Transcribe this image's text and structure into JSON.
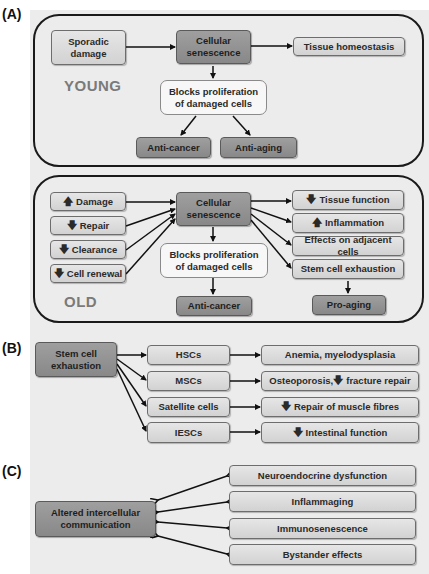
{
  "panel_a": {
    "label": "(A)",
    "young": {
      "stage_label": "YOUNG",
      "sporadic_damage": "Sporadic damage",
      "cellular_senescence": "Cellular senescence",
      "tissue_homeostasis": "Tissue homeostasis",
      "blocks_proliferation": "Blocks proliferation of damaged cells",
      "anti_cancer": "Anti-cancer",
      "anti_aging": "Anti-aging"
    },
    "old": {
      "stage_label": "OLD",
      "inputs": [
        {
          "arrow": "up",
          "glyph": "🡅",
          "label": "Damage"
        },
        {
          "arrow": "down",
          "glyph": "🡇",
          "label": "Repair"
        },
        {
          "arrow": "down",
          "glyph": "🡇",
          "label": "Clearance"
        },
        {
          "arrow": "down",
          "glyph": "🡇",
          "label": "Cell renewal"
        }
      ],
      "cellular_senescence": "Cellular senescence",
      "blocks_proliferation": "Blocks proliferation of damaged cells",
      "anti_cancer": "Anti-cancer",
      "outputs": [
        {
          "arrow": "down",
          "glyph": "🡇",
          "label": "Tissue function"
        },
        {
          "arrow": "up",
          "glyph": "🡅",
          "label": "Inflammation"
        },
        {
          "arrow": "",
          "glyph": "",
          "label": "Effects on adjacent cells"
        },
        {
          "arrow": "",
          "glyph": "",
          "label": "Stem cell exhaustion"
        }
      ],
      "pro_aging": "Pro-aging"
    }
  },
  "panel_b": {
    "label": "(B)",
    "source": "Stem cell exhaustion",
    "rows": [
      {
        "cell_type": "HSCs",
        "glyph": "",
        "effect": "Anemia, myelodysplasia"
      },
      {
        "cell_type": "MSCs",
        "glyph": "",
        "effect_prefix": "Osteoporosis, ",
        "effect_glyph": "🡇",
        "effect": "fracture repair"
      },
      {
        "cell_type": "Satellite cells",
        "glyph": "🡇",
        "effect": "Repair of muscle fibres"
      },
      {
        "cell_type": "IESCs",
        "glyph": "🡇",
        "effect": "Intestinal function"
      }
    ]
  },
  "panel_c": {
    "label": "(C)",
    "source": "Altered intercellular communication",
    "targets": [
      "Neuroendocrine dysfunction",
      "Inflammaging",
      "Immunosenescence",
      "Bystander effects"
    ]
  },
  "colors": {
    "background": "#ececec",
    "light_box": "#dcdcdc",
    "dark_box": "#939393",
    "white_box": "#f7f7f7",
    "border": "#1a1a1a",
    "stage_label": "#7a7a7a"
  }
}
